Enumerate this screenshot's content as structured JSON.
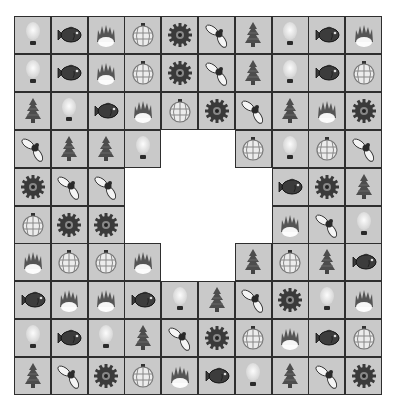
{
  "game": {
    "title": "Tile matching puzzle board",
    "rows": 10,
    "cols": 10,
    "tile_colors": {
      "background": "#c9c9c9",
      "border": "#2e2e2e",
      "icon_dark": "#3a3a3a",
      "icon_light": "#f2f2f2"
    },
    "grid": [
      [
        "bulb",
        "fish",
        "fire",
        "lantern",
        "gear",
        "fly",
        "tree",
        "bulb",
        "fish",
        "fire"
      ],
      [
        "bulb",
        "fish",
        "fire",
        "lantern",
        "gear",
        "fly",
        "tree",
        "bulb",
        "fish",
        "lantern"
      ],
      [
        "tree",
        "bulb",
        "fish",
        "fire",
        "lantern",
        "gear",
        "fly",
        "tree",
        "fire",
        "gear"
      ],
      [
        "fly",
        "tree",
        "tree",
        "bulb",
        null,
        null,
        "lantern",
        "bulb",
        "lantern",
        "fly"
      ],
      [
        "gear",
        "fly",
        "fly",
        null,
        null,
        null,
        null,
        "fish",
        "gear",
        "tree"
      ],
      [
        "lantern",
        "gear",
        "gear",
        null,
        null,
        null,
        null,
        "fire",
        "fly",
        "bulb"
      ],
      [
        "fire",
        "lantern",
        "lantern",
        "fire",
        null,
        null,
        "tree",
        "lantern",
        "tree",
        "fish"
      ],
      [
        "fish",
        "fire",
        "fire",
        "fish",
        "bulb",
        "tree",
        "fly",
        "gear",
        "bulb",
        "fire"
      ],
      [
        "bulb",
        "fish",
        "bulb",
        "tree",
        "fly",
        "gear",
        "lantern",
        "fire",
        "fish",
        "lantern"
      ],
      [
        "tree",
        "fly",
        "gear",
        "lantern",
        "fire",
        "fish",
        "bulb",
        "tree",
        "fly",
        "gear"
      ]
    ]
  }
}
